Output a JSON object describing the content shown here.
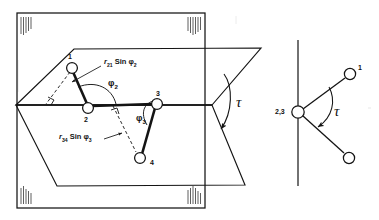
{
  "figure": {
    "ink_color": "#141414",
    "paper_color": "#ffffff"
  },
  "left_diagram": {
    "name": "hinged-planes-perspective-view",
    "atoms": [
      {
        "id": "atom-1",
        "label": "1",
        "x": 72,
        "y": 68
      },
      {
        "id": "atom-2",
        "label": "2",
        "x": 88,
        "y": 106
      },
      {
        "id": "atom-3",
        "label": "3",
        "x": 157,
        "y": 104
      },
      {
        "id": "atom-4",
        "label": "4",
        "x": 140,
        "y": 158
      }
    ],
    "annotations": [
      {
        "id": "r21-sin-phi2",
        "base": "r",
        "sub": "21",
        "op": "Sin",
        "angle": "φ",
        "angle_sub": "2",
        "x": 104,
        "y": 62
      },
      {
        "id": "phi2",
        "symbol": "φ",
        "sub": "2",
        "x": 111,
        "y": 84
      },
      {
        "id": "phi3",
        "symbol": "φ",
        "sub": "3",
        "x": 139,
        "y": 118
      },
      {
        "id": "r34-sin-phi3",
        "base": "r",
        "sub": "34",
        "op": "Sin",
        "angle": "φ",
        "angle_sub": "3",
        "x": 60,
        "y": 136
      },
      {
        "id": "tau-left",
        "symbol": "τ",
        "x": 238,
        "y": 95
      }
    ]
  },
  "right_diagram": {
    "name": "newman-projection-view",
    "atoms": [
      {
        "id": "atom-23",
        "label": "2,3",
        "x": 298,
        "y": 112
      },
      {
        "id": "atom-1-newman",
        "label": "1",
        "x": 353,
        "y": 72
      },
      {
        "id": "atom-4-newman",
        "label": "",
        "x": 351,
        "y": 158
      }
    ],
    "annotations": [
      {
        "id": "tau-right",
        "symbol": "τ",
        "x": 337,
        "y": 111
      }
    ]
  }
}
